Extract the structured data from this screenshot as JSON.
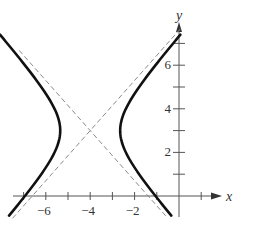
{
  "chart_data": {
    "type": "line",
    "title": "",
    "xlabel": "x",
    "ylabel": "y",
    "xlim": [
      -7.5,
      1.8
    ],
    "ylim": [
      -1,
      7.8
    ],
    "grid": false,
    "legend": null,
    "x_ticks": [
      -7,
      -6,
      -5,
      -4,
      -3,
      -2,
      -1,
      1
    ],
    "x_tick_labels": [
      {
        "value": -6,
        "label": "−6"
      },
      {
        "value": -4,
        "label": "−4"
      },
      {
        "value": -2,
        "label": "−2"
      }
    ],
    "y_ticks": [
      1,
      2,
      3,
      4,
      5,
      6,
      7
    ],
    "y_tick_labels": [
      {
        "value": 2,
        "label": "2"
      },
      {
        "value": 4,
        "label": "4"
      },
      {
        "value": 6,
        "label": "6"
      }
    ],
    "curve": {
      "kind": "hyperbola",
      "orientation": "horizontal",
      "center": [
        -4,
        3
      ],
      "a": 1.35,
      "b": 1.55,
      "y_range": [
        -0.9,
        7.4
      ],
      "vertices": [
        [
          -5.35,
          3
        ],
        [
          -2.65,
          3
        ]
      ],
      "style": "solid-thick"
    },
    "asymptotes": [
      {
        "through": [
          -4,
          3
        ],
        "slope": 1.15,
        "style": "dashed",
        "x_range": [
          -7.5,
          0.05
        ]
      },
      {
        "through": [
          -4,
          3
        ],
        "slope": -1.15,
        "style": "dashed",
        "x_range": [
          -7.2,
          -0.6
        ]
      }
    ],
    "colors": {
      "curve": "#111111",
      "asymptote": "#8a8a8a",
      "axis": "#555555"
    }
  }
}
